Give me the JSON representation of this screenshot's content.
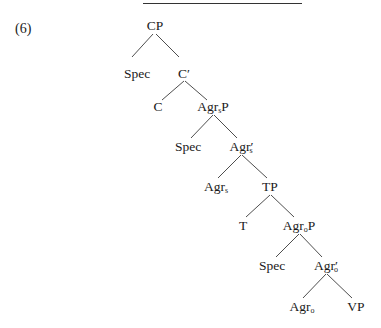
{
  "example": {
    "number": "(6)"
  },
  "tree": {
    "nodes": [
      {
        "id": "cp",
        "label": "CP",
        "sub": "",
        "prime": "",
        "suffix": "",
        "x": 155,
        "y": 18
      },
      {
        "id": "spec1",
        "label": "Spec",
        "sub": "",
        "prime": "",
        "suffix": "",
        "x": 137,
        "y": 66
      },
      {
        "id": "cbar",
        "label": "C",
        "sub": "",
        "prime": "′",
        "suffix": "",
        "x": 184,
        "y": 66
      },
      {
        "id": "c",
        "label": "C",
        "sub": "",
        "prime": "",
        "suffix": "",
        "x": 158,
        "y": 99
      },
      {
        "id": "agrsp",
        "label": "Agr",
        "sub": "s",
        "prime": "",
        "suffix": "P",
        "x": 213,
        "y": 99
      },
      {
        "id": "spec2",
        "label": "Spec",
        "sub": "",
        "prime": "",
        "suffix": "",
        "x": 188,
        "y": 139
      },
      {
        "id": "agrsbar",
        "label": "Agr",
        "sub": "s",
        "prime": "′",
        "suffix": "",
        "x": 241,
        "y": 139
      },
      {
        "id": "agrs",
        "label": "Agr",
        "sub": "s",
        "prime": "",
        "suffix": "",
        "x": 216,
        "y": 179
      },
      {
        "id": "tp",
        "label": "TP",
        "sub": "",
        "prime": "",
        "suffix": "",
        "x": 270,
        "y": 179
      },
      {
        "id": "t",
        "label": "T",
        "sub": "",
        "prime": "",
        "suffix": "",
        "x": 243,
        "y": 218
      },
      {
        "id": "agrop",
        "label": "Agr",
        "sub": "o",
        "prime": "",
        "suffix": "P",
        "x": 299,
        "y": 218
      },
      {
        "id": "spec3",
        "label": "Spec",
        "sub": "",
        "prime": "",
        "suffix": "",
        "x": 272,
        "y": 258
      },
      {
        "id": "agrobar",
        "label": "Agr",
        "sub": "o",
        "prime": "′",
        "suffix": "",
        "x": 326,
        "y": 258
      },
      {
        "id": "agro",
        "label": "Agr",
        "sub": "o",
        "prime": "",
        "suffix": "",
        "x": 302,
        "y": 299
      },
      {
        "id": "vp",
        "label": "VP",
        "sub": "",
        "prime": "",
        "suffix": "",
        "x": 356,
        "y": 299
      }
    ],
    "edges": [
      {
        "from": "CP",
        "to": "Spec"
      },
      {
        "from": "CP",
        "to": "C′"
      },
      {
        "from": "C′",
        "to": "C"
      },
      {
        "from": "C′",
        "to": "AgrsP"
      },
      {
        "from": "AgrsP",
        "to": "Spec"
      },
      {
        "from": "AgrsP",
        "to": "Agrs′"
      },
      {
        "from": "Agrs′",
        "to": "Agrs"
      },
      {
        "from": "Agrs′",
        "to": "TP"
      },
      {
        "from": "TP",
        "to": "T"
      },
      {
        "from": "TP",
        "to": "AgroP"
      },
      {
        "from": "AgroP",
        "to": "Spec"
      },
      {
        "from": "AgroP",
        "to": "Agro′"
      },
      {
        "from": "Agro′",
        "to": "Agro"
      },
      {
        "from": "Agro′",
        "to": "VP"
      }
    ]
  }
}
